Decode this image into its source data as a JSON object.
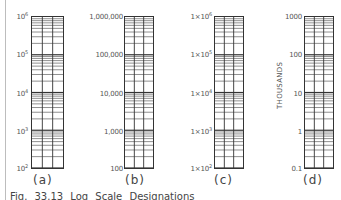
{
  "figure": {
    "caption": "Fig. 33.13   Log Scale Designations",
    "panels": [
      {
        "id": "a",
        "label": "(a)",
        "ticks": [
          {
            "base": "10",
            "exp": "6"
          },
          {
            "base": "10",
            "exp": "5"
          },
          {
            "base": "10",
            "exp": "4"
          },
          {
            "base": "10",
            "exp": "3"
          },
          {
            "base": "10",
            "exp": "2"
          }
        ]
      },
      {
        "id": "b",
        "label": "(b)",
        "ticks": [
          {
            "base": "1,000,000",
            "exp": ""
          },
          {
            "base": "100,000",
            "exp": ""
          },
          {
            "base": "10,000",
            "exp": ""
          },
          {
            "base": "1,000",
            "exp": ""
          },
          {
            "base": "100",
            "exp": ""
          }
        ]
      },
      {
        "id": "c",
        "label": "(c)",
        "ticks": [
          {
            "base": "1×10",
            "exp": "6"
          },
          {
            "base": "1×10",
            "exp": "5"
          },
          {
            "base": "1×10",
            "exp": "4"
          },
          {
            "base": "1×10",
            "exp": "3"
          },
          {
            "base": "1×10",
            "exp": "2"
          }
        ]
      },
      {
        "id": "d",
        "label": "(d)",
        "unit_label": "THOUSANDS",
        "ticks": [
          {
            "base": "1000",
            "exp": ""
          },
          {
            "base": "100",
            "exp": ""
          },
          {
            "base": "10",
            "exp": ""
          },
          {
            "base": "1",
            "exp": ""
          },
          {
            "base": "0.1",
            "exp": ""
          }
        ]
      }
    ],
    "decades": 4,
    "columns_per_grid": 3
  }
}
